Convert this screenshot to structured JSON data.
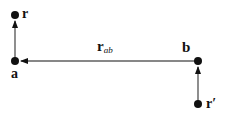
{
  "diagram": {
    "type": "vector-diagram",
    "points": [
      {
        "id": "r",
        "label": "r",
        "x": 15,
        "y": 15
      },
      {
        "id": "a",
        "label": "a",
        "x": 15,
        "y": 60
      },
      {
        "id": "b",
        "label": "b",
        "x": 198,
        "y": 61
      },
      {
        "id": "r_prime",
        "label": "r′",
        "x": 198,
        "y": 103
      }
    ],
    "arrows": [
      {
        "from": "a",
        "to": "r"
      },
      {
        "from": "b",
        "to": "a",
        "label": "r",
        "label_sub": "ab"
      },
      {
        "from": "r_prime",
        "to": "b"
      }
    ],
    "colors": {
      "stroke": "#111111",
      "background": "#ffffff"
    }
  }
}
